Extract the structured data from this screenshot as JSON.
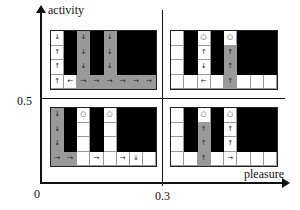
{
  "axes": {
    "y_label": "activity",
    "x_label": "pleasure",
    "y_tick": "0.5",
    "x_tick": "0.3",
    "origin": "0"
  },
  "legend_colors": {
    "black": "#000000",
    "gray": "#999999",
    "white": "#ffffff"
  },
  "panels": [
    {
      "id": "top-left",
      "rows": [
        [
          [
            "w",
            "↓"
          ],
          [
            "k",
            ""
          ],
          [
            "g",
            "↓"
          ],
          [
            "k",
            ""
          ],
          [
            "g",
            "↓"
          ],
          [
            "k",
            ""
          ],
          [
            "k",
            ""
          ],
          [
            "k",
            ""
          ]
        ],
        [
          [
            "w",
            "↑"
          ],
          [
            "k",
            ""
          ],
          [
            "g",
            "↓"
          ],
          [
            "k",
            ""
          ],
          [
            "g",
            "↓"
          ],
          [
            "k",
            ""
          ],
          [
            "k",
            ""
          ],
          [
            "k",
            ""
          ]
        ],
        [
          [
            "w",
            "↑"
          ],
          [
            "k",
            ""
          ],
          [
            "g",
            "↓"
          ],
          [
            "k",
            ""
          ],
          [
            "g",
            "↓"
          ],
          [
            "k",
            ""
          ],
          [
            "k",
            ""
          ],
          [
            "k",
            ""
          ]
        ],
        [
          [
            "w",
            "↑"
          ],
          [
            "w",
            "←"
          ],
          [
            "g",
            "→"
          ],
          [
            "g",
            "→"
          ],
          [
            "g",
            "→"
          ],
          [
            "g",
            "→"
          ],
          [
            "g",
            "→"
          ],
          [
            "g",
            "→"
          ]
        ]
      ]
    },
    {
      "id": "top-right",
      "rows": [
        [
          [
            "w",
            ""
          ],
          [
            "k",
            ""
          ],
          [
            "w",
            "○"
          ],
          [
            "k",
            ""
          ],
          [
            "w",
            "○"
          ],
          [
            "k",
            ""
          ],
          [
            "k",
            ""
          ],
          [
            "k",
            ""
          ]
        ],
        [
          [
            "w",
            ""
          ],
          [
            "k",
            ""
          ],
          [
            "w",
            "↑"
          ],
          [
            "k",
            ""
          ],
          [
            "g",
            "↑"
          ],
          [
            "k",
            ""
          ],
          [
            "k",
            ""
          ],
          [
            "k",
            ""
          ]
        ],
        [
          [
            "w",
            ""
          ],
          [
            "k",
            ""
          ],
          [
            "w",
            "↓"
          ],
          [
            "k",
            ""
          ],
          [
            "g",
            "↑"
          ],
          [
            "k",
            ""
          ],
          [
            "k",
            ""
          ],
          [
            "k",
            ""
          ]
        ],
        [
          [
            "w",
            ""
          ],
          [
            "w",
            ""
          ],
          [
            "w",
            "←"
          ],
          [
            "w",
            ""
          ],
          [
            "g",
            "↑"
          ],
          [
            "w",
            ""
          ],
          [
            "w",
            ""
          ],
          [
            "w",
            ""
          ]
        ]
      ]
    },
    {
      "id": "bottom-left",
      "rows": [
        [
          [
            "g",
            "↓"
          ],
          [
            "k",
            ""
          ],
          [
            "w",
            "○"
          ],
          [
            "k",
            ""
          ],
          [
            "w",
            "○"
          ],
          [
            "k",
            ""
          ],
          [
            "k",
            ""
          ],
          [
            "k",
            ""
          ]
        ],
        [
          [
            "g",
            "↓"
          ],
          [
            "k",
            ""
          ],
          [
            "w",
            ""
          ],
          [
            "k",
            ""
          ],
          [
            "w",
            ""
          ],
          [
            "k",
            ""
          ],
          [
            "k",
            ""
          ],
          [
            "k",
            ""
          ]
        ],
        [
          [
            "g",
            "↓"
          ],
          [
            "k",
            ""
          ],
          [
            "w",
            ""
          ],
          [
            "k",
            ""
          ],
          [
            "w",
            ""
          ],
          [
            "k",
            ""
          ],
          [
            "k",
            ""
          ],
          [
            "k",
            ""
          ]
        ],
        [
          [
            "g",
            "→"
          ],
          [
            "g",
            "→"
          ],
          [
            "w",
            ""
          ],
          [
            "w",
            "→"
          ],
          [
            "w",
            ""
          ],
          [
            "w",
            "→"
          ],
          [
            "w",
            "↓"
          ],
          [
            "w",
            ""
          ]
        ]
      ]
    },
    {
      "id": "bottom-right",
      "rows": [
        [
          [
            "w",
            ""
          ],
          [
            "k",
            ""
          ],
          [
            "w",
            "○"
          ],
          [
            "k",
            ""
          ],
          [
            "w",
            "○"
          ],
          [
            "k",
            ""
          ],
          [
            "k",
            ""
          ],
          [
            "k",
            ""
          ]
        ],
        [
          [
            "w",
            ""
          ],
          [
            "k",
            ""
          ],
          [
            "g",
            "↑"
          ],
          [
            "k",
            ""
          ],
          [
            "w",
            "↑"
          ],
          [
            "k",
            ""
          ],
          [
            "k",
            ""
          ],
          [
            "k",
            ""
          ]
        ],
        [
          [
            "w",
            ""
          ],
          [
            "k",
            ""
          ],
          [
            "g",
            "↑"
          ],
          [
            "k",
            ""
          ],
          [
            "w",
            "↑"
          ],
          [
            "k",
            ""
          ],
          [
            "k",
            ""
          ],
          [
            "k",
            ""
          ]
        ],
        [
          [
            "w",
            ""
          ],
          [
            "w",
            ""
          ],
          [
            "g",
            "↑"
          ],
          [
            "w",
            ""
          ],
          [
            "w",
            "→"
          ],
          [
            "w",
            ""
          ],
          [
            "w",
            ""
          ],
          [
            "w",
            ""
          ]
        ]
      ]
    }
  ]
}
